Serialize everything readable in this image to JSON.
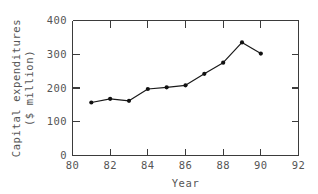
{
  "chart_data": {
    "type": "line",
    "title": "",
    "xlabel": "Year",
    "ylabel": "Capital expenditures ($ million)",
    "ylabel_line1": "Capital expenditures",
    "ylabel_line2": "($ million)",
    "x": [
      81,
      82,
      83,
      84,
      85,
      86,
      87,
      88,
      89,
      90
    ],
    "values": [
      157,
      168,
      162,
      197,
      202,
      208,
      242,
      275,
      335,
      302
    ],
    "series": [
      {
        "name": "Capital expenditures",
        "values": [
          157,
          168,
          162,
          197,
          202,
          208,
          242,
          275,
          335,
          302
        ]
      }
    ],
    "xlim": [
      80,
      92
    ],
    "ylim": [
      0,
      400
    ],
    "xticks": [
      80,
      82,
      84,
      86,
      88,
      90,
      92
    ],
    "yticks": [
      0,
      100,
      200,
      300,
      400
    ],
    "xtick_labels": [
      "80",
      "82",
      "84",
      "86",
      "88",
      "90",
      "92"
    ],
    "ytick_labels": [
      "0",
      "100",
      "200",
      "300",
      "400"
    ],
    "grid": false,
    "legend": false,
    "marker": "filled-circle",
    "line_color": "#1a1a1a",
    "marker_color": "#111111",
    "axis_color": "#3b3b3b",
    "text_color": "#555555",
    "background_color": "#ffffff",
    "tick_direction": "in"
  }
}
